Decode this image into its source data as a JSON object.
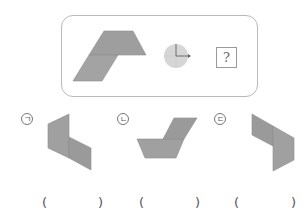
{
  "question_box": {
    "symbol": "?"
  },
  "rotation_indicator": {
    "type": "clockwise-quarter-turn",
    "fill": "#d6d6d6"
  },
  "shape_color": "#9e9e9e",
  "options": [
    {
      "label": "ㄱ",
      "open": "(",
      "close": ")"
    },
    {
      "label": "ㄴ",
      "open": "(",
      "close": ")"
    },
    {
      "label": "ㄷ",
      "open": "(",
      "close": ")"
    }
  ]
}
